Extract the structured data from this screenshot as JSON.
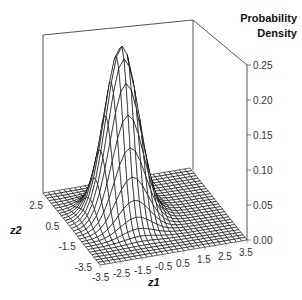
{
  "chart_data": {
    "type": "surface3d",
    "title": "",
    "zlabel": [
      "Probability",
      "Density"
    ],
    "xlabel": "z1",
    "ylabel": "z2",
    "x_ticks": [
      "-3.5",
      "-2.5",
      "-1.5",
      "-0.5",
      "0.5",
      "1.5",
      "2.5",
      "3.5"
    ],
    "y_ticks": [
      "-3.5",
      "-1.5",
      "0.5",
      "2.5"
    ],
    "z_ticks": [
      "0.00",
      "0.05",
      "0.10",
      "0.15",
      "0.20",
      "0.25"
    ],
    "xlim": [
      -3.5,
      3.5
    ],
    "ylim": [
      -3.5,
      3.5
    ],
    "zlim": [
      0,
      0.25
    ],
    "surface": {
      "function": "bivariate_normal",
      "mean": [
        -1.0,
        0.3
      ],
      "std": [
        0.75,
        0.85
      ],
      "correlation": 0.0,
      "peak_density": 0.245,
      "grid_step": 0.25
    },
    "grid": false,
    "wireframe_color": "#000000",
    "box_color": "#555555"
  }
}
